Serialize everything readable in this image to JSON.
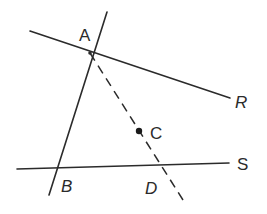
{
  "diagram": {
    "title": "",
    "colors": {
      "ink": "#2b2b2b",
      "background": "#ffffff"
    },
    "points": [
      {
        "id": "A",
        "label": "A",
        "x": 90,
        "y": 53,
        "marked": false
      },
      {
        "id": "B",
        "label": "B",
        "x": 60,
        "y": 168,
        "marked": false
      },
      {
        "id": "C",
        "label": "C",
        "x": 139,
        "y": 131,
        "marked": true
      },
      {
        "id": "D",
        "label": "D",
        "x": 160,
        "y": 166,
        "marked": false
      },
      {
        "id": "R",
        "label": "R",
        "x": 230,
        "y": 98,
        "marked": false
      },
      {
        "id": "S",
        "label": "S",
        "x": 229,
        "y": 163,
        "marked": false
      }
    ],
    "lines": [
      {
        "id": "AR",
        "style": "solid",
        "from": [
          30,
          31
        ],
        "to": [
          230,
          98
        ]
      },
      {
        "id": "AB",
        "style": "solid",
        "from": [
          107,
          12
        ],
        "to": [
          49,
          195
        ]
      },
      {
        "id": "BS",
        "style": "solid",
        "from": [
          17,
          169
        ],
        "to": [
          229,
          163
        ]
      },
      {
        "id": "AD",
        "style": "dashed",
        "from": [
          90,
          53
        ],
        "to": [
          183,
          200
        ]
      }
    ],
    "labels": {
      "A": "A",
      "B": "B",
      "C": "C",
      "D": "D",
      "R": "R",
      "S": "S"
    }
  }
}
